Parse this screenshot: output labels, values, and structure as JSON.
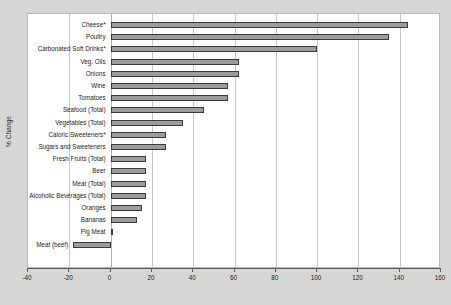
{
  "chart_data": {
    "type": "bar",
    "orientation": "horizontal",
    "title": "",
    "xlabel": "",
    "ylabel": "% Change",
    "xlim": [
      -40,
      160
    ],
    "xticks": [
      -40,
      -20,
      0,
      20,
      40,
      60,
      80,
      100,
      120,
      140,
      160
    ],
    "grid": true,
    "grid_axis": "x",
    "legend": null,
    "bar_color": "#9c9c9c",
    "bar_edge_color": "#3a3a3a",
    "plot_background": "#ffffff",
    "figure_background": "#d6d6d4",
    "categories": [
      "Cheese*",
      "Poultry",
      "Carbonated Soft Drinks*",
      "Veg. Oils",
      "Onions",
      "Wine",
      "Tomatoes",
      "Seafood (Total)",
      "Vegetables (Total)",
      "Caloric Sweeteners*",
      "Sugars and Sweeteners",
      "Fresh Fruits (Total)",
      "Beer",
      "Meat (Total)",
      "Alcoholic Beverages (Total)",
      "Oranges",
      "Bananas",
      "Pig Meat",
      "Meat (beef)"
    ],
    "values": [
      144,
      135,
      100,
      62,
      62,
      57,
      57,
      45,
      35,
      27,
      27,
      17,
      17,
      17,
      17,
      15,
      13,
      1,
      -18
    ]
  }
}
